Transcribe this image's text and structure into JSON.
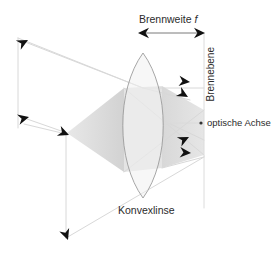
{
  "diagram": {
    "labels": {
      "focal_length": "Brennweite",
      "focal_length_symbol": "f",
      "focal_plane": "Brennebene",
      "optical_axis": "optische Achse",
      "lens": "Konvexlinse"
    },
    "colors": {
      "ray_line": "#d6d6d6",
      "lens_outline": "#9a9a9a",
      "arrow_fill": "#111111",
      "cone_fill": "#d9d9d9",
      "lens_fill": "#ededed",
      "text": "#2b2b2b",
      "background": "#ffffff"
    },
    "geometry": {
      "lens_apex_top": [
        143,
        53
      ],
      "lens_apex_bottom": [
        143,
        198
      ],
      "lens_half_width": 21,
      "focal_plane_x": 204,
      "optical_axis_y": 123,
      "focal_length_arrow": [
        137,
        33,
        205,
        33
      ]
    },
    "elements": {
      "arrowheads": [
        {
          "name": "arrowhead-object-top",
          "x": 25,
          "y": 40,
          "angle": -30
        },
        {
          "name": "arrowhead-object-mid",
          "x": 27,
          "y": 117,
          "angle": -18
        },
        {
          "name": "arrowhead-object-base",
          "x": 66,
          "y": 133,
          "angle": 20
        },
        {
          "name": "arrowhead-image-upper",
          "x": 186,
          "y": 82,
          "angle": 8
        },
        {
          "name": "arrowhead-image-upper2",
          "x": 183,
          "y": 96,
          "angle": 32
        },
        {
          "name": "arrowhead-image-lower",
          "x": 185,
          "y": 136,
          "angle": -28
        },
        {
          "name": "arrowhead-image-lower2",
          "x": 187,
          "y": 152,
          "angle": 5
        },
        {
          "name": "arrowhead-bottom",
          "x": 66,
          "y": 237,
          "angle": 72
        },
        {
          "name": "arrowhead-focal-left",
          "x": 140,
          "y": 33,
          "angle": 180
        },
        {
          "name": "arrowhead-focal-right",
          "x": 202,
          "y": 33,
          "angle": 0
        }
      ]
    }
  }
}
